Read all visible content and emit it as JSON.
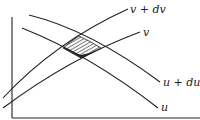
{
  "diagram": {
    "type": "curvilinear coordinate mesh element",
    "colors": {
      "ink": "#222222",
      "background": "#ffffff"
    },
    "curves": [
      {
        "id": "v_plus_dv",
        "label": "v + dv",
        "direction": "rising"
      },
      {
        "id": "v",
        "label": "v",
        "direction": "rising"
      },
      {
        "id": "u_plus_du",
        "label": "u + du",
        "direction": "falling"
      },
      {
        "id": "u",
        "label": "u",
        "direction": "falling"
      }
    ],
    "labels": {
      "v_plus_dv": "v + dv",
      "v": "v",
      "u_plus_du": "u + du",
      "u": "u"
    },
    "area_element": {
      "description": "hatched parallelogram bounded by u, u+du, v, v+dv",
      "fill": "hatched"
    },
    "axes": {
      "vertical": true,
      "horizontal": true
    }
  }
}
